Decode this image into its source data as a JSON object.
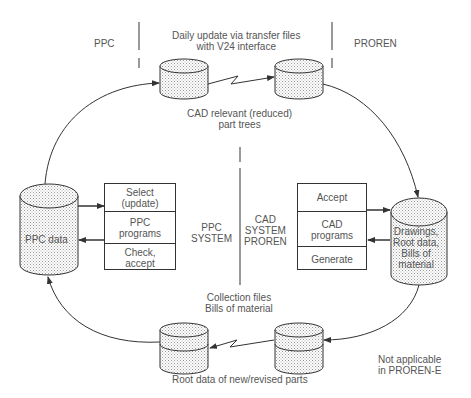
{
  "regions": {
    "left": "PPC",
    "right": "PROREN",
    "top_transfer": "Daily update via transfer files\nwith V24 interface"
  },
  "top_transfer_label": "CAD relevant (reduced)\npart trees",
  "bottom_transfer_top_label": "Collection files\nBills of material",
  "bottom_transfer_label": "Root data of new/revised parts",
  "note": "Not applicable\nin PROREN-E",
  "ppc": {
    "database": "PPC data",
    "system_label": "PPC\nSYSTEM",
    "steps": [
      "Select\n(update)",
      "PPC\nprograms",
      "Check,\naccept"
    ]
  },
  "cad": {
    "database": "Drawings,\nRoot data,\nBills of\nmaterial",
    "system_label": "CAD\nSYSTEM\nPROREN",
    "steps": [
      "Accept",
      "CAD\nprograms",
      "Generate"
    ]
  },
  "colors": {
    "line": "#333333",
    "text": "#555555",
    "fill_dots": "#999999"
  }
}
